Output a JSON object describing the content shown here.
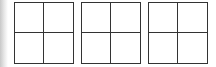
{
  "figure": {
    "line_color": "#333333",
    "background": "#ffffff",
    "grids": [
      {
        "id": "grid-1",
        "rows": 2,
        "cols": 2,
        "left": 14,
        "cells": [
          "",
          "",
          "",
          ""
        ]
      },
      {
        "id": "grid-2",
        "rows": 2,
        "cols": 2,
        "left": 81,
        "cells": [
          "",
          "",
          "",
          ""
        ]
      },
      {
        "id": "grid-3",
        "rows": 2,
        "cols": 2,
        "left": 148,
        "cells": [
          "",
          "",
          "",
          ""
        ]
      }
    ]
  }
}
